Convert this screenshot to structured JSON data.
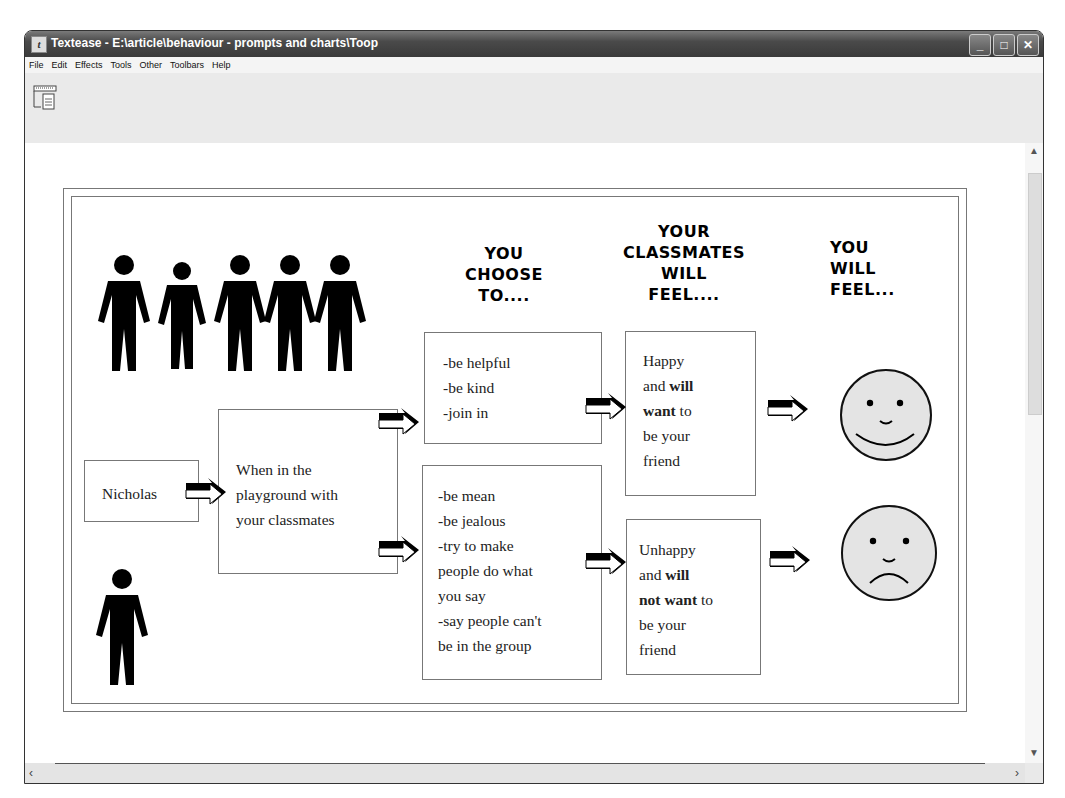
{
  "window": {
    "title": "Textease - E:\\article\\behaviour - prompts and charts\\Toop",
    "app_icon": "textease-icon",
    "controls": {
      "minimize": "_",
      "maximize": "□",
      "close": "✕"
    }
  },
  "menubar": {
    "items": [
      "File",
      "Edit",
      "Effects",
      "Tools",
      "Other",
      "Toolbars",
      "Help"
    ]
  },
  "toolbar": {
    "icons": [
      "page-view-icon"
    ]
  },
  "document": {
    "headings": {
      "choose": "YOU CHOOSE TO....",
      "choose_lines": [
        "YOU",
        "CHOOSE",
        "TO...."
      ],
      "classmates_lines": [
        "YOUR",
        "CLASSMATES",
        "WILL",
        "FEEL...."
      ],
      "you_feel_lines": [
        "YOU",
        "WILL",
        "FEEL..."
      ]
    },
    "name_box": "Nicholas",
    "situation_box": [
      "When in the",
      "playground with",
      "your classmates"
    ],
    "good_choices": [
      "-be helpful",
      "-be kind",
      "-join in"
    ],
    "bad_choices": [
      "-be mean",
      "-be jealous",
      "-try to make",
      "people do what",
      "you say",
      "-say people can't",
      "be in the group"
    ],
    "good_outcome": {
      "line1": "Happy",
      "line2_plain": "and ",
      "line2_bold": "will",
      "line3_bold": "want",
      "line3_plain": " to",
      "line4": "be your",
      "line5": "friend"
    },
    "bad_outcome": {
      "line1": "Unhappy",
      "line2_plain": "and ",
      "line2_bold": "will",
      "line3_bold": "not want",
      "line3_plain": " to",
      "line4": "be your",
      "line5": "friend"
    },
    "faces": [
      "happy-face",
      "sad-face"
    ],
    "figures": {
      "group_count": 5,
      "single_count": 1
    },
    "colors": {
      "face_fill": "#e4e4e4",
      "figure": "#000000",
      "border": "#777777"
    }
  },
  "scrollbars": {
    "vertical": "scrollbar",
    "horizontal": "scrollbar"
  }
}
